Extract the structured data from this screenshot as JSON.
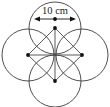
{
  "figure": {
    "canvas": {
      "width": 110,
      "height": 107
    },
    "colors": {
      "stroke": "#3c3c3c",
      "dimension": "#111111",
      "label_text": "#1a1a1a",
      "background": "#ffffff"
    },
    "dimension": {
      "label": "10 cm",
      "value": 10,
      "unit": "cm",
      "measures": "diameter",
      "applies_to": "top-circle",
      "x1": 34,
      "x2": 76,
      "y": 19,
      "midpoint_x": 55
    },
    "circles": [
      {
        "name": "top-circle",
        "cx": 55,
        "cy": 28,
        "r": 26,
        "center_dot_r": 1.9
      },
      {
        "name": "left-circle",
        "cx": 28,
        "cy": 55,
        "r": 26,
        "center_dot_r": 1.9
      },
      {
        "name": "right-circle",
        "cx": 82,
        "cy": 55,
        "r": 26,
        "center_dot_r": 1.9
      },
      {
        "name": "bottom-circle",
        "cx": 55,
        "cy": 81,
        "r": 26,
        "center_dot_r": 1.9
      }
    ],
    "square": {
      "name": "center-square",
      "vertices": "55,28 82,55 55,81 28,55",
      "diagonal_a": {
        "x1": 55,
        "y1": 28,
        "x2": 55,
        "y2": 81
      },
      "diagonal_b": {
        "x1": 28,
        "y1": 55,
        "x2": 82,
        "y2": 55
      }
    }
  }
}
